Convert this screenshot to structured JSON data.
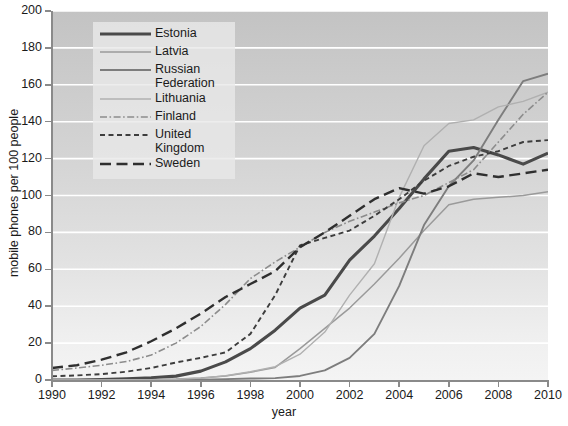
{
  "chart_data": {
    "type": "line",
    "title": "",
    "xlabel": "year",
    "ylabel": "mobile phones per 100 people",
    "xlim": [
      1990,
      2010
    ],
    "ylim": [
      0,
      200
    ],
    "grid": true,
    "legend_position": "top-center-inside",
    "x_ticks": [
      "1990",
      "1992",
      "1994",
      "1996",
      "1998",
      "2000",
      "2002",
      "2004",
      "2006",
      "2008",
      "2010"
    ],
    "y_ticks": [
      "0",
      "20",
      "40",
      "60",
      "80",
      "100",
      "120",
      "140",
      "160",
      "180",
      "200"
    ],
    "x": [
      1990,
      1991,
      1992,
      1993,
      1994,
      1995,
      1996,
      1997,
      1998,
      1999,
      2000,
      2001,
      2002,
      2003,
      2004,
      2005,
      2006,
      2007,
      2008,
      2009,
      2010
    ],
    "series": [
      {
        "name": "Estonia",
        "style": "solid",
        "color": "#4a4a4a",
        "width": 3.1,
        "values": [
          0,
          0,
          0.3,
          0.6,
          1.2,
          2.1,
          4.8,
          9.8,
          17,
          27,
          39,
          46,
          65,
          78,
          93,
          109,
          124,
          126,
          122,
          117,
          123
        ]
      },
      {
        "name": "Latvia",
        "style": "solid",
        "color": "#9a9a9a",
        "width": 1.5,
        "values": [
          0,
          0,
          0,
          0.1,
          0.2,
          0.5,
          1.1,
          2.2,
          4.2,
          6.8,
          17,
          28,
          39,
          52,
          66,
          81,
          95,
          98,
          99,
          100,
          102
        ]
      },
      {
        "name": "Russian Federation",
        "style": "solid",
        "color": "#7d7d7d",
        "width": 1.9,
        "values": [
          0,
          0,
          0,
          0,
          0,
          0,
          0.2,
          0.5,
          0.8,
          1.0,
          2.2,
          5.2,
          12,
          25,
          51,
          84,
          105,
          119,
          141,
          162,
          166
        ]
      },
      {
        "name": "Lithuania",
        "style": "solid",
        "color": "#b0b0b0",
        "width": 1.4,
        "values": [
          0,
          0,
          0,
          0.1,
          0.2,
          0.4,
          1.0,
          2.3,
          4.5,
          7.2,
          14,
          26,
          46,
          63,
          99,
          127,
          139,
          141,
          148,
          151,
          156
        ]
      },
      {
        "name": "Finland",
        "style": "dashdot",
        "color": "#8c8c8c",
        "width": 1.6,
        "values": [
          5.2,
          6.5,
          8.0,
          10.0,
          13.5,
          20.0,
          29.0,
          41.0,
          55.0,
          64.0,
          72.0,
          80.0,
          86.0,
          91.0,
          96.0,
          100.0,
          107.0,
          114.0,
          129.0,
          144.0,
          156.0
        ]
      },
      {
        "name": "United Kingdom",
        "style": "dashed-small",
        "color": "#3d3d3d",
        "width": 1.9,
        "values": [
          2.0,
          2.5,
          3.2,
          4.5,
          6.5,
          9.5,
          12.0,
          15.0,
          25.0,
          46.0,
          73.0,
          77.0,
          81.0,
          89.0,
          98.0,
          108.0,
          116.0,
          121.0,
          124.0,
          129.0,
          130.0
        ]
      },
      {
        "name": "Sweden",
        "style": "dashed-large",
        "color": "#2f2f2f",
        "width": 2.4,
        "values": [
          6.5,
          8.0,
          11.0,
          15.0,
          21.0,
          28.0,
          36.0,
          45.0,
          52.0,
          59.0,
          72.0,
          80.0,
          89.0,
          98.0,
          104.0,
          101.0,
          105.0,
          112.0,
          110.0,
          112.0,
          114.0
        ]
      }
    ]
  },
  "legend": {
    "items": [
      {
        "label": "Estonia"
      },
      {
        "label": "Latvia"
      },
      {
        "label": "Russian Federation"
      },
      {
        "label": "Lithuania"
      },
      {
        "label": "Finland"
      },
      {
        "label": "United Kingdom"
      },
      {
        "label": "Sweden"
      }
    ]
  }
}
